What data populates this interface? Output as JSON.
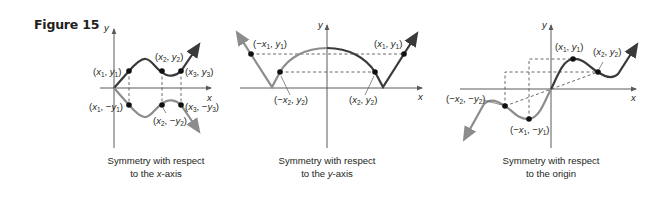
{
  "figure": {
    "label": "Figure 15"
  },
  "panels": [
    {
      "id": "x-axis-symmetry",
      "caption_line1": "Symmetry with respect",
      "caption_line2_pre": "to the ",
      "caption_line2_var": "x",
      "caption_line2_post": "-axis",
      "axis_labels": {
        "x": "x",
        "y": "y"
      },
      "points": [
        {
          "label": "(x1, y1)"
        },
        {
          "label": "(x2, y2)"
        },
        {
          "label": "(x3, y3)"
        },
        {
          "label": "(x1, -y1)"
        },
        {
          "label": "(x2, -y2)"
        },
        {
          "label": "(x3, -y3)"
        }
      ]
    },
    {
      "id": "y-axis-symmetry",
      "caption_line1": "Symmetry with respect",
      "caption_line2_pre": "to the ",
      "caption_line2_var": "y",
      "caption_line2_post": "-axis",
      "axis_labels": {
        "x": "x",
        "y": "y"
      },
      "points": [
        {
          "label": "(-x1, y1)"
        },
        {
          "label": "(-x2, y2)"
        },
        {
          "label": "(x2, y2)"
        },
        {
          "label": "(x1, y1)"
        }
      ]
    },
    {
      "id": "origin-symmetry",
      "caption_line1": "Symmetry with respect",
      "caption_line2_pre": "to the origin",
      "caption_line2_var": "",
      "caption_line2_post": "",
      "axis_labels": {
        "x": "x",
        "y": "y"
      },
      "points": [
        {
          "label": "(x1, y1)"
        },
        {
          "label": "(x2, y2)"
        },
        {
          "label": "(-x2, -y2)"
        },
        {
          "label": "(-x1, -y1)"
        }
      ]
    }
  ],
  "colors": {
    "dark_curve": "#3a3a3a",
    "light_curve": "#8c8c8c",
    "axis": "#5a5a5a",
    "text": "#231f20"
  }
}
